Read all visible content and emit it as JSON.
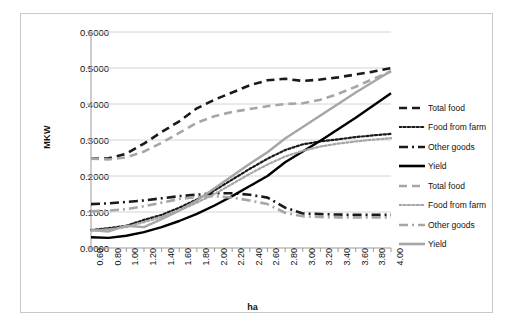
{
  "chart_data": {
    "type": "line",
    "title": "",
    "xlabel": "ha",
    "ylabel": "MKW",
    "xlim": [
      0.6,
      4.0
    ],
    "ylim": [
      0.0,
      0.6
    ],
    "grid": true,
    "legend_position": "right",
    "x_tick_labels": [
      "0.60",
      "0.80",
      "1.00",
      "1.20",
      "1.40",
      "1.60",
      "1.80",
      "2.00",
      "2.20",
      "2.40",
      "2.60",
      "2.80",
      "3.00",
      "3.20",
      "3.40",
      "3.60",
      "3.80",
      "4.00"
    ],
    "y_tick_labels": [
      "0.0000",
      "0.1000",
      "0.2000",
      "0.3000",
      "0.4000",
      "0.5000",
      "0.6000"
    ],
    "x": [
      0.6,
      0.8,
      1.0,
      1.2,
      1.4,
      1.6,
      1.8,
      2.0,
      2.2,
      2.4,
      2.6,
      2.8,
      3.0,
      3.2,
      3.4,
      3.6,
      3.8,
      4.0
    ],
    "series": [
      {
        "name": "Total food",
        "group": "black",
        "color": "#1a1a1a",
        "dash": "dashed",
        "values": [
          0.248,
          0.249,
          0.262,
          0.29,
          0.322,
          0.352,
          0.388,
          0.412,
          0.432,
          0.452,
          0.466,
          0.47,
          0.464,
          0.468,
          0.474,
          0.482,
          0.49,
          0.5
        ]
      },
      {
        "name": "Food from farm",
        "group": "black",
        "color": "#1a1a1a",
        "dash": "dotted",
        "values": [
          0.05,
          0.055,
          0.062,
          0.078,
          0.092,
          0.112,
          0.135,
          0.16,
          0.19,
          0.22,
          0.248,
          0.272,
          0.288,
          0.296,
          0.302,
          0.308,
          0.313,
          0.317
        ]
      },
      {
        "name": "Other goods",
        "group": "black",
        "color": "#1a1a1a",
        "dash": "dashdot",
        "values": [
          0.122,
          0.124,
          0.128,
          0.132,
          0.138,
          0.144,
          0.148,
          0.152,
          0.152,
          0.148,
          0.14,
          0.112,
          0.096,
          0.094,
          0.093,
          0.092,
          0.092,
          0.092
        ]
      },
      {
        "name": "Yield",
        "group": "black",
        "color": "#000000",
        "dash": "solid",
        "values": [
          0.03,
          0.028,
          0.034,
          0.044,
          0.058,
          0.075,
          0.095,
          0.118,
          0.144,
          0.172,
          0.2,
          0.238,
          0.268,
          0.298,
          0.33,
          0.362,
          0.396,
          0.43
        ]
      },
      {
        "name": "Total food",
        "group": "gray",
        "color": "#a6a6a6",
        "dash": "dashed",
        "values": [
          0.248,
          0.246,
          0.252,
          0.268,
          0.292,
          0.32,
          0.348,
          0.366,
          0.378,
          0.386,
          0.394,
          0.4,
          0.402,
          0.412,
          0.428,
          0.448,
          0.47,
          0.49
        ]
      },
      {
        "name": "Food from farm",
        "group": "gray",
        "color": "#a6a6a6",
        "dash": "dotted",
        "values": [
          0.048,
          0.052,
          0.058,
          0.072,
          0.086,
          0.104,
          0.126,
          0.15,
          0.178,
          0.206,
          0.232,
          0.254,
          0.27,
          0.282,
          0.29,
          0.296,
          0.301,
          0.305
        ]
      },
      {
        "name": "Other goods",
        "group": "gray",
        "color": "#a6a6a6",
        "dash": "dashdot",
        "values": [
          0.102,
          0.104,
          0.108,
          0.116,
          0.126,
          0.136,
          0.142,
          0.144,
          0.14,
          0.132,
          0.122,
          0.098,
          0.088,
          0.086,
          0.085,
          0.085,
          0.085,
          0.085
        ]
      },
      {
        "name": "Yield",
        "group": "gray",
        "color": "#a6a6a6",
        "dash": "solid",
        "values": [
          0.05,
          0.046,
          0.062,
          0.058,
          0.08,
          0.104,
          0.132,
          0.166,
          0.2,
          0.234,
          0.266,
          0.304,
          0.336,
          0.368,
          0.4,
          0.432,
          0.462,
          0.492
        ]
      }
    ],
    "legend_entries": [
      {
        "label": "Total food",
        "color": "#1a1a1a",
        "dash": "dashed"
      },
      {
        "label": "Food from farm",
        "color": "#1a1a1a",
        "dash": "dotted"
      },
      {
        "label": "Other goods",
        "color": "#1a1a1a",
        "dash": "dashdot"
      },
      {
        "label": "Yield",
        "color": "#000000",
        "dash": "solid"
      },
      {
        "label": "Total food",
        "color": "#a6a6a6",
        "dash": "dashed"
      },
      {
        "label": "Food from farm",
        "color": "#a6a6a6",
        "dash": "dotted"
      },
      {
        "label": "Other goods",
        "color": "#a6a6a6",
        "dash": "dashdot"
      },
      {
        "label": "Yield",
        "color": "#a6a6a6",
        "dash": "solid"
      }
    ]
  },
  "style": {
    "frame_border_color": "#c9c9c9",
    "gridline_color": "#d4d4d4",
    "axis_color": "#9a9a9a",
    "background": "#ffffff"
  }
}
